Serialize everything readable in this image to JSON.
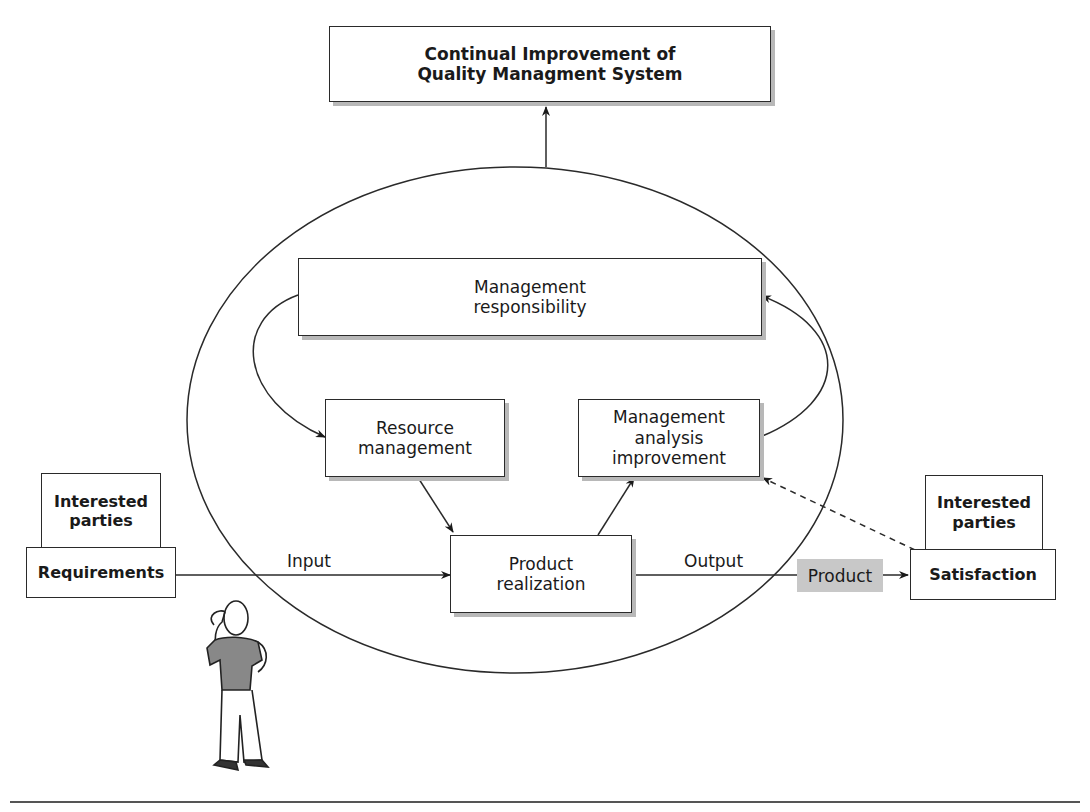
{
  "diagram": {
    "title_box": {
      "lines": [
        "Continual Improvement of",
        "Quality Managment System"
      ]
    },
    "process_boxes": {
      "management_responsibility": {
        "lines": [
          "Management",
          "responsibility"
        ]
      },
      "resource_management": {
        "lines": [
          "Resource",
          "management"
        ]
      },
      "management_analysis": {
        "lines": [
          "Management",
          "analysis",
          "improvement"
        ]
      },
      "product_realization": {
        "lines": [
          "Product",
          "realization"
        ]
      }
    },
    "left_stack": {
      "top": {
        "lines": [
          "Interested",
          "parties"
        ]
      },
      "bottom": {
        "label": "Requirements"
      }
    },
    "right_stack": {
      "top": {
        "lines": [
          "Interested",
          "parties"
        ]
      },
      "bottom": {
        "label": "Satisfaction"
      }
    },
    "flow_labels": {
      "input": "Input",
      "output": "Output",
      "product": "Product"
    },
    "colors": {
      "line": "#2a2a2a",
      "shadow": "#b8b8b8",
      "product_fill": "#c8c8c8"
    },
    "illustration": "person-scratching-head"
  }
}
